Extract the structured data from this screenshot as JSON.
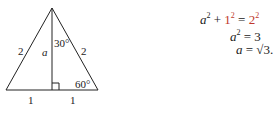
{
  "diagram": {
    "type": "equilateral-triangle-bisected",
    "labels": {
      "left_side": "2",
      "right_side": "2",
      "altitude": "a",
      "top_angle": "30°",
      "bottom_right_angle": "60°",
      "base_left": "1",
      "base_right": "1"
    }
  },
  "equations": {
    "line1": {
      "lhs_var": "a",
      "lhs_exp": "2",
      "plus": "+",
      "term": "1",
      "term_exp": "2",
      "eq": "=",
      "rhs": "2",
      "rhs_exp": "2"
    },
    "line2": {
      "lhs_var": "a",
      "lhs_exp": "2",
      "eq": "=",
      "rhs": "3"
    },
    "line3": {
      "lhs_var": "a",
      "eq": "=",
      "rhs": "√3."
    }
  },
  "colors": {
    "highlight": "#c0392b",
    "line": "#222222"
  }
}
